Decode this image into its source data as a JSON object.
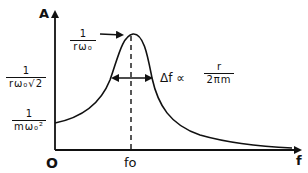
{
  "diagram": {
    "y_axis_label": "A",
    "x_axis_label": "f",
    "origin_label": "O",
    "resonance_label": "f0",
    "resonance_label_main": "f",
    "resonance_label_sub": "o",
    "peak_label": {
      "numerator": "1",
      "denominator": "rω₀"
    },
    "half_power_label": {
      "numerator": "1",
      "denominator": "rω₀√2"
    },
    "static_label": {
      "numerator": "1",
      "denominator": "mω₀²"
    },
    "bandwidth_label": {
      "lhs": "Δf ∝",
      "numerator": "r",
      "denominator": "2πm"
    },
    "colors": {
      "ink": "#111111",
      "background": "#ffffff"
    }
  }
}
